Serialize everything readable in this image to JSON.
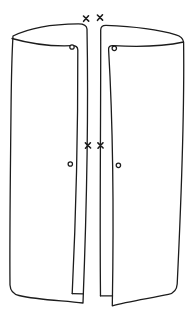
{
  "canvas": {
    "width": 188,
    "height": 322,
    "background": "#ffffff",
    "ink": "#1c1c1c"
  },
  "figure": {
    "type": "hand-drawn-line-sketch",
    "panels": [
      {
        "id": "left-panel",
        "outline": "M13,36 C28,28.5 52,24 78,23.8 Q86.5,23.6 87,29 C88.5,110 87,200 83,303 C62,300.5 38,300 19,295.5 Q10.5,293.5 10,285 C9.5,235 10.5,165 11,112 C11.3,82 12,52 13,36 Z",
        "inner_edge": "M12,38.5 C32,44.2 55,46.4 72,45.7 Q77.8,45.4 77.8,50 C78,135 75.5,225 72.2,293.6",
        "step": "M72.2,293.6 L83.4,293.8"
      },
      {
        "id": "right-panel",
        "outline": "M100.5,295.8 C99.6,212 100.9,112 100.7,30 Q100.7,25.3 106,25.4 C132,26.4 160,30 176,34.8 Q182.8,36.8 183.6,42 C184.4,104 181,205 177.2,284 Q176.6,292.6 168.4,294.4 C148,298.6 127,301.6 112.3,305.8 C113.6,232 114,142 108.6,49.8 Q108.2,45.3 113.2,45.6 C136,47 162,46.6 183.6,42",
        "step": "M100.4,295.8 L112.5,295.9"
      }
    ],
    "x_marks": [
      {
        "d": "M83.5,16 L88.7,21.1 M88.5,15.8 L83.6,21.3"
      },
      {
        "d": "M97.4,15 L102.6,20.1 M102.5,14.8 L97.5,20.3"
      },
      {
        "d": "M85.4,142.9 L90.6,148 M90.4,142.8 L85.5,148.2"
      },
      {
        "d": "M97.9,142.9 L103.1,148 M103,142.8 L98,148.2"
      }
    ],
    "o_marks": [
      {
        "x": 72,
        "y": 47,
        "r": 2.2
      },
      {
        "x": 114.3,
        "y": 48.3,
        "r": 2.2
      },
      {
        "x": 70.3,
        "y": 164,
        "r": 2.2
      },
      {
        "x": 118.4,
        "y": 165.3,
        "r": 2.2
      }
    ]
  }
}
